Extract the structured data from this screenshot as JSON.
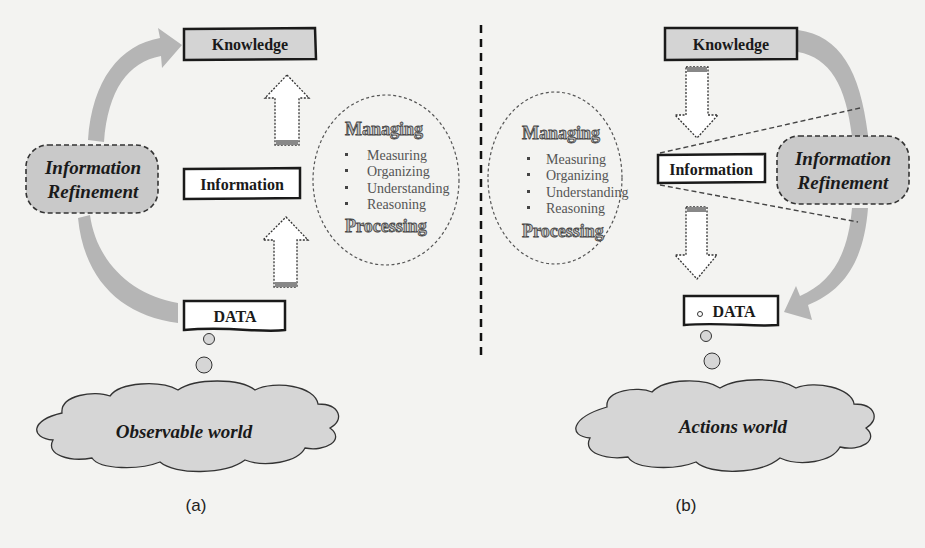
{
  "panels": [
    {
      "id": "a",
      "caption": "(a)",
      "boxes": {
        "knowledge": "Knowledge",
        "information": "Information",
        "data": "DATA"
      },
      "refinement_label": [
        "Information",
        "Refinement"
      ],
      "world_label": "Observable world",
      "process_circle": {
        "heading_top": "Managing",
        "items": [
          "Measuring",
          "Organizing",
          "Understanding",
          "Reasoning"
        ],
        "heading_bottom": "Processing"
      },
      "flow_direction": "up"
    },
    {
      "id": "b",
      "caption": "(b)",
      "boxes": {
        "knowledge": "Knowledge",
        "information": "Information",
        "data": "DATA"
      },
      "refinement_label": [
        "Information",
        "Refinement"
      ],
      "world_label": "Actions world",
      "process_circle": {
        "heading_top": "Managing",
        "items": [
          "Measuring",
          "Organizing",
          "Understanding",
          "Reasoning"
        ],
        "heading_bottom": "Processing"
      },
      "flow_direction": "down"
    }
  ],
  "colors": {
    "background": "#f3f3f1",
    "box_fill_knowledge": "#d4d4d4",
    "box_fill_plain": "#ffffff",
    "curved_arrow": "#b5b5b5",
    "refinement_fill": "#c9c9c9",
    "cloud_fill": "#d6d6d6",
    "stroke": "#1a1a1a"
  }
}
